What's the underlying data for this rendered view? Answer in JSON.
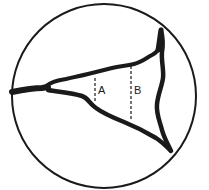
{
  "diagram": {
    "type": "grain-boundary cross-section",
    "outline": "circle",
    "labels": {
      "a": "A",
      "b": "B"
    },
    "colors": {
      "ink": "#1a1a1a",
      "background": "#ffffff"
    }
  }
}
